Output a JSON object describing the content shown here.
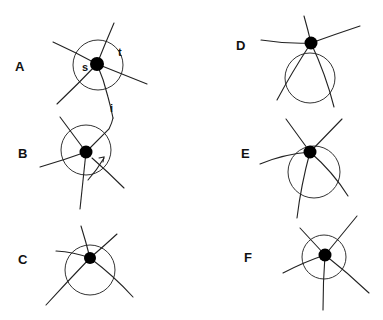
{
  "figure": {
    "panels": [
      {
        "id": "A",
        "label": "A",
        "annotations": [
          "s",
          "t",
          "i"
        ]
      },
      {
        "id": "B",
        "label": "B"
      },
      {
        "id": "C",
        "label": "C"
      },
      {
        "id": "D",
        "label": "D"
      },
      {
        "id": "E",
        "label": "E"
      },
      {
        "id": "F",
        "label": "F"
      }
    ],
    "colors": {
      "ink": "#000000",
      "background": "#ffffff"
    }
  }
}
